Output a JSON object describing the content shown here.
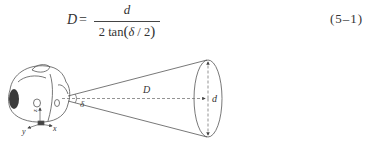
{
  "equation": {
    "lhs": "D",
    "equals": "=",
    "numerator": "d",
    "denominator_prefix": "2 tan",
    "denominator_open": "(",
    "denominator_var": "δ",
    "denominator_rest": " / 2",
    "denominator_close": ")",
    "number": "(5–1)"
  },
  "diagram": {
    "labels": {
      "distance": "D",
      "diameter": "d",
      "angle": "δ",
      "axis_x": "x",
      "axis_y": "y",
      "axis_z": "z"
    },
    "colors": {
      "line": "#555555",
      "dashed": "#666666",
      "grille": "#3a3a3a"
    }
  }
}
